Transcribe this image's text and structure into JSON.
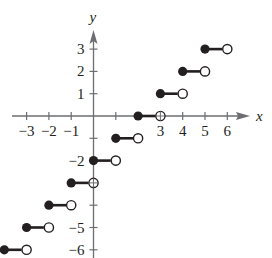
{
  "chart_data": {
    "type": "line",
    "title": "",
    "function": "f(x) = [[x]] - 2 (greatest integer step function)",
    "xlabel": "x",
    "ylabel": "y",
    "xlim": [
      -3.5,
      7
    ],
    "ylim": [
      -6.2,
      4.1
    ],
    "grid": false,
    "x_tick_labels": [
      "-3",
      "-2",
      "-1",
      "3",
      "4",
      "5",
      "6"
    ],
    "x_ticks": [
      -3,
      -2,
      -1,
      1,
      2,
      3,
      4,
      5,
      6
    ],
    "y_tick_labels": [
      "3",
      "2",
      "1",
      "-2",
      "-5",
      "-6"
    ],
    "y_ticks": [
      3,
      2,
      1,
      -1,
      -2,
      -3,
      -4,
      -5,
      -6
    ],
    "segments": [
      {
        "x_start": -4,
        "x_end": -3,
        "y": -6,
        "start_closed": true,
        "end_closed": false
      },
      {
        "x_start": -3,
        "x_end": -2,
        "y": -5,
        "start_closed": true,
        "end_closed": false
      },
      {
        "x_start": -2,
        "x_end": -1,
        "y": -4,
        "start_closed": true,
        "end_closed": false
      },
      {
        "x_start": -1,
        "x_end": 0,
        "y": -3,
        "start_closed": true,
        "end_closed": false
      },
      {
        "x_start": 0,
        "x_end": 1,
        "y": -2,
        "start_closed": true,
        "end_closed": false
      },
      {
        "x_start": 1,
        "x_end": 2,
        "y": -1,
        "start_closed": true,
        "end_closed": false
      },
      {
        "x_start": 2,
        "x_end": 3,
        "y": 0,
        "start_closed": true,
        "end_closed": false
      },
      {
        "x_start": 3,
        "x_end": 4,
        "y": 1,
        "start_closed": true,
        "end_closed": false
      },
      {
        "x_start": 4,
        "x_end": 5,
        "y": 2,
        "start_closed": true,
        "end_closed": false
      },
      {
        "x_start": 5,
        "x_end": 6,
        "y": 3,
        "start_closed": true,
        "end_closed": false
      }
    ]
  },
  "colors": {
    "ink": "#231f20",
    "axis": "#6d6e71",
    "background": "#ffffff"
  }
}
